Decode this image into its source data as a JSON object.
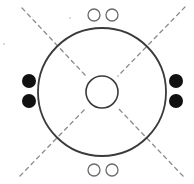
{
  "diagram": {
    "width": 194,
    "height": 184,
    "colors": {
      "background": "#ffffff",
      "stroke": "#3a3a3a",
      "dash": "#8a8a8a",
      "filled": "#111111",
      "open_stroke": "#6a6a6a"
    },
    "outer_circle": {
      "cx": 102,
      "cy": 92,
      "r": 64
    },
    "inner_circle": {
      "cx": 102,
      "cy": 92,
      "r": 16
    },
    "diagonals": [
      {
        "name": "top-left",
        "x1": 22,
        "y1": 8,
        "x2": 86,
        "y2": 76
      },
      {
        "name": "top-right",
        "x1": 185,
        "y1": 7,
        "x2": 118,
        "y2": 76
      },
      {
        "name": "bottom-left",
        "x1": 20,
        "y1": 176,
        "x2": 86,
        "y2": 108
      },
      {
        "name": "bottom-right",
        "x1": 183,
        "y1": 176,
        "x2": 118,
        "y2": 108
      }
    ],
    "open_circles": {
      "top": [
        {
          "cx": 94,
          "cy": 15,
          "r": 6
        },
        {
          "cx": 112,
          "cy": 15,
          "r": 6
        }
      ],
      "bottom": [
        {
          "cx": 94,
          "cy": 170,
          "r": 6
        },
        {
          "cx": 112,
          "cy": 170,
          "r": 6
        }
      ]
    },
    "filled_circles": {
      "left": [
        {
          "cx": 29,
          "cy": 81,
          "r": 7
        },
        {
          "cx": 29,
          "cy": 101,
          "r": 7
        }
      ],
      "right": [
        {
          "cx": 176,
          "cy": 81,
          "r": 7
        },
        {
          "cx": 176,
          "cy": 101,
          "r": 7
        }
      ]
    },
    "stray_marks": [
      {
        "cx": 4,
        "cy": 44,
        "r": 0.8
      },
      {
        "cx": 70,
        "cy": 18,
        "r": 0.8
      }
    ]
  }
}
